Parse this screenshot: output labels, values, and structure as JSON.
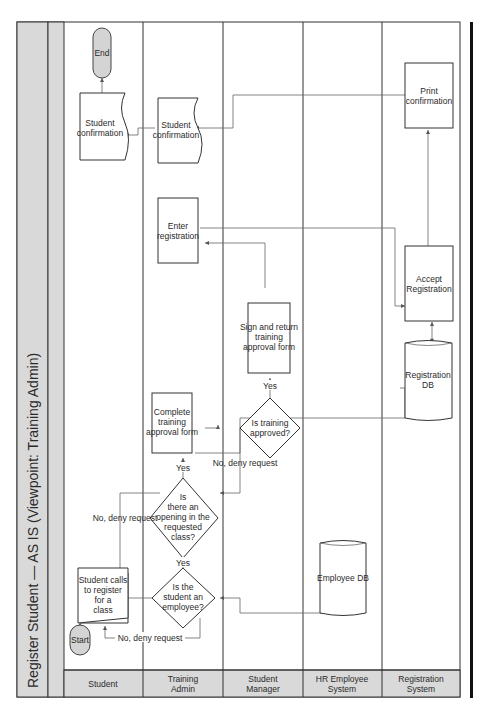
{
  "diagram": {
    "title": "Register Student  —  AS IS (Viewpoint: Training Admin)",
    "lanes": [
      {
        "label_line1": "Student",
        "label_line2": ""
      },
      {
        "label_line1": "Training",
        "label_line2": "Admin"
      },
      {
        "label_line1": "Student",
        "label_line2": "Manager"
      },
      {
        "label_line1": "HR Employee",
        "label_line2": "System"
      },
      {
        "label_line1": "Registration",
        "label_line2": "System"
      }
    ],
    "nodes": {
      "start": "Start",
      "end": "End",
      "student_calls": [
        "Student calls",
        "to register",
        "for a",
        "class"
      ],
      "is_employee": [
        "Is the",
        "student an",
        "employee?"
      ],
      "is_opening": [
        "Is",
        "there an",
        "opening in the",
        "requested",
        "class?"
      ],
      "complete_form": [
        "Complete",
        "training",
        "approval form"
      ],
      "is_approved": [
        "Is training",
        "approved?"
      ],
      "sign_return": [
        "Sign and return",
        "training",
        "approval form"
      ],
      "enter_registration": [
        "Enter",
        "registration"
      ],
      "student_confirmation_1": [
        "Student",
        "confirmation"
      ],
      "student_confirmation_2": [
        "Student",
        "confirmation"
      ],
      "employee_db": [
        "Employee DB"
      ],
      "registration_db": [
        "Registration",
        "DB"
      ],
      "accept_registration": [
        "Accept",
        "Registration"
      ],
      "print_confirmation": [
        "Print",
        "confirmation"
      ]
    },
    "edge_labels": {
      "yes_1": "Yes",
      "yes_2": "Yes",
      "yes_3": "Yes",
      "no_deny_1": "No, deny request",
      "no_deny_2": "No, deny request",
      "no_deny_3": "No, deny request"
    },
    "colors": {
      "header_fill": "#d9d9d9",
      "terminator_fill": "#d4d4d4",
      "line": "#666666"
    }
  }
}
